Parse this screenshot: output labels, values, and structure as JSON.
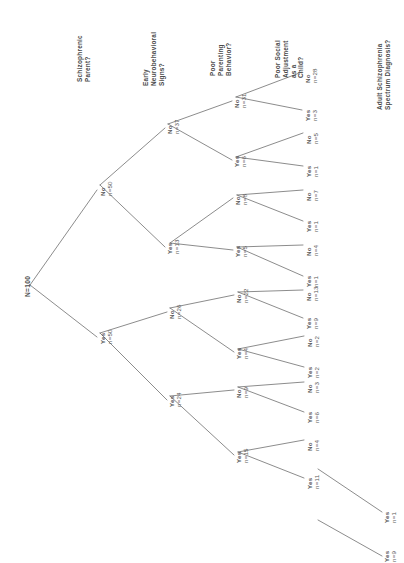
{
  "figure": {
    "type": "decision-tree",
    "orientation": "rotated-90-counterclockwise",
    "background_color": "#ffffff",
    "line_color": "#5a5a5a",
    "text_color": "#4a4a4a"
  },
  "headers": [
    {
      "id": "h1",
      "lines": [
        "Schizophrenic",
        "Parent?"
      ]
    },
    {
      "id": "h2",
      "lines": [
        "Early",
        "Neurobehavioral",
        "Signs?"
      ]
    },
    {
      "id": "h3",
      "lines": [
        "Poor",
        "Parenting",
        "Behavior?"
      ]
    },
    {
      "id": "h4",
      "lines": [
        "Poor Social",
        "Adjustment",
        "as a",
        "Child?"
      ]
    },
    {
      "id": "h5",
      "lines": [
        "Adult Schizophrenia",
        "Spectrum Diagnosis?"
      ]
    }
  ],
  "root": {
    "label": "N=100"
  },
  "nodes": [
    {
      "id": "n1",
      "answer": "No",
      "count": "n=50"
    },
    {
      "id": "n2",
      "answer": "Yes",
      "count": "n=50"
    },
    {
      "id": "n3",
      "answer": "No",
      "count": "n=37"
    },
    {
      "id": "n4",
      "answer": "Yes",
      "count": "n=13"
    },
    {
      "id": "n5",
      "answer": "No",
      "count": "n=26"
    },
    {
      "id": "n6",
      "answer": "Yes",
      "count": "n=24"
    },
    {
      "id": "n7",
      "answer": "No",
      "count": "n=31"
    },
    {
      "id": "n8",
      "answer": "Yes",
      "count": "n=6"
    },
    {
      "id": "n9",
      "answer": "No",
      "count": "n=8"
    },
    {
      "id": "n10",
      "answer": "Yes",
      "count": "n=5"
    },
    {
      "id": "n11",
      "answer": "No",
      "count": "n=22"
    },
    {
      "id": "n12",
      "answer": "Yes",
      "count": "n=4"
    },
    {
      "id": "n13",
      "answer": "No",
      "count": "n=9"
    },
    {
      "id": "n14",
      "answer": "Yes",
      "count": "n=15"
    },
    {
      "id": "n15",
      "answer": "No",
      "count": "n=28"
    },
    {
      "id": "n16",
      "answer": "Yes",
      "count": "n=3"
    },
    {
      "id": "n17",
      "answer": "No",
      "count": "n=5"
    },
    {
      "id": "n18",
      "answer": "Yes",
      "count": "n=1"
    },
    {
      "id": "n19",
      "answer": "No",
      "count": "n=7"
    },
    {
      "id": "n20",
      "answer": "Yes",
      "count": "n=1"
    },
    {
      "id": "n21",
      "answer": "No",
      "count": "n=4"
    },
    {
      "id": "n22",
      "answer": "Yes",
      "count": "n=1"
    },
    {
      "id": "n23",
      "answer": "No",
      "count": "n=13"
    },
    {
      "id": "n24",
      "answer": "Yes",
      "count": "n=9"
    },
    {
      "id": "n25",
      "answer": "No",
      "count": "n=2"
    },
    {
      "id": "n26",
      "answer": "Yes",
      "count": "n=2"
    },
    {
      "id": "n27",
      "answer": "No",
      "count": "n=3"
    },
    {
      "id": "n28",
      "answer": "Yes",
      "count": "n=6"
    },
    {
      "id": "n29",
      "answer": "No",
      "count": "n=4"
    },
    {
      "id": "n30",
      "answer": "Yes",
      "count": "n=11"
    },
    {
      "id": "n31",
      "answer": "Yes",
      "count": "n=1"
    },
    {
      "id": "n32",
      "answer": "Yes",
      "count": "n=9"
    }
  ]
}
